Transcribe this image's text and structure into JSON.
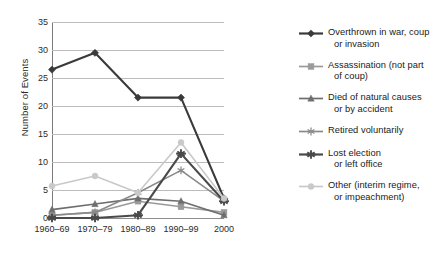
{
  "chart_data": {
    "type": "line",
    "title": "",
    "xlabel": "",
    "ylabel": "Number of Events",
    "categories": [
      "1960–69",
      "1970–79",
      "1980–89",
      "1990–99",
      "2000"
    ],
    "ylim": [
      0,
      35
    ],
    "ytick_step": 5,
    "yticks": [
      "0",
      "5",
      "10",
      "15",
      "20",
      "25",
      "30",
      "35"
    ],
    "grid": true,
    "legend_position": "right",
    "series": [
      {
        "name": "Overthrown in war, coup or invasion",
        "label_line1": "Overthrown in war, coup",
        "label_line2": "or invasion",
        "marker": "diamond",
        "color": "#3a3a3a",
        "values": [
          26.5,
          29.5,
          21.5,
          21.5,
          3.5
        ]
      },
      {
        "name": "Assassination (not part of coup)",
        "label_line1": "Assassination (not part",
        "label_line2": "of coup)",
        "marker": "square",
        "color": "#9a9a9a",
        "values": [
          0.5,
          1,
          3,
          2,
          1
        ]
      },
      {
        "name": "Died of natural causes or by accident",
        "label_line1": "Died of natural causes",
        "label_line2": "or by accident",
        "marker": "triangle",
        "color": "#6e6e6e",
        "values": [
          1.5,
          2.5,
          3.5,
          3,
          0.5
        ]
      },
      {
        "name": "Retired voluntarily",
        "label_line1": "Retired voluntarily",
        "label_line2": "",
        "marker": "asterisk",
        "color": "#8a8a8a",
        "values": [
          0.5,
          1,
          4.5,
          8.5,
          3
        ]
      },
      {
        "name": "Lost election or left office",
        "label_line1": "Lost election",
        "label_line2": "or left office",
        "marker": "star",
        "color": "#4a4a4a",
        "values": [
          0,
          0,
          0.5,
          11.5,
          3
        ]
      },
      {
        "name": "Other (interim regime, or impeachment)",
        "label_line1": "Other (interim regime,",
        "label_line2": "or impeachment)",
        "marker": "circle",
        "color": "#c9c9c9",
        "values": [
          5.7,
          7.5,
          4.5,
          13.5,
          3.5
        ]
      }
    ]
  }
}
